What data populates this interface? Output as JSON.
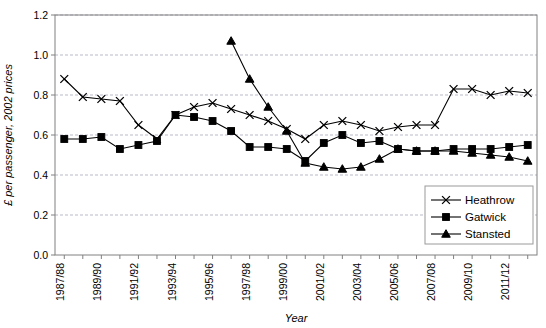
{
  "chart_data": {
    "type": "line",
    "title": "",
    "xlabel": "Year",
    "ylabel": "£ per passenger, 2002 prices",
    "ylim": [
      0.0,
      1.2
    ],
    "ytick_labels": [
      "0.0",
      "0.2",
      "0.4",
      "0.6",
      "0.8",
      "1.0",
      "1.2"
    ],
    "ytick_values": [
      0.0,
      0.2,
      0.4,
      0.6,
      0.8,
      1.0,
      1.2
    ],
    "grid": true,
    "grid_axis": "y",
    "legend_position": "bottom-right",
    "x": [
      "1987/88",
      "1988/89",
      "1989/90",
      "1990/91",
      "1991/92",
      "1992/93",
      "1993/94",
      "1994/95",
      "1995/96",
      "1996/97",
      "1997/98",
      "1998/99",
      "1999/00",
      "2000/01",
      "2001/02",
      "2002/03",
      "2003/04",
      "2004/05",
      "2005/06",
      "2006/07",
      "2007/08",
      "2008/09",
      "2009/10",
      "2010/11",
      "2011/12",
      "2012/13"
    ],
    "xtick_labels": [
      "1987/88",
      "1989/90",
      "1991/92",
      "1993/94",
      "1995/96",
      "1997/98",
      "1999/00",
      "2001/02",
      "2003/04",
      "2005/06",
      "2007/08",
      "2009/10",
      "2011/12"
    ],
    "series": [
      {
        "name": "Heathrow",
        "marker": "x",
        "values": [
          0.88,
          0.79,
          0.78,
          0.77,
          0.65,
          0.58,
          0.7,
          0.74,
          0.76,
          0.73,
          0.7,
          0.67,
          0.63,
          0.58,
          0.65,
          0.67,
          0.65,
          0.62,
          0.64,
          0.65,
          0.65,
          0.83,
          0.83,
          0.8,
          0.82,
          0.81
        ]
      },
      {
        "name": "Gatwick",
        "marker": "square",
        "values": [
          0.58,
          0.58,
          0.59,
          0.53,
          0.55,
          0.57,
          0.7,
          0.69,
          0.67,
          0.62,
          0.54,
          0.54,
          0.53,
          0.47,
          0.56,
          0.6,
          0.56,
          0.57,
          0.53,
          0.52,
          0.52,
          0.53,
          0.53,
          0.53,
          0.54,
          0.55
        ]
      },
      {
        "name": "Stansted",
        "marker": "triangle",
        "values": [
          null,
          null,
          null,
          null,
          null,
          null,
          null,
          null,
          null,
          1.07,
          0.88,
          0.74,
          0.62,
          0.46,
          0.44,
          0.43,
          0.44,
          0.48,
          0.53,
          0.52,
          0.52,
          0.52,
          0.51,
          0.5,
          0.49,
          0.47
        ]
      }
    ]
  },
  "legend": {
    "entries": [
      {
        "label": "Heathrow"
      },
      {
        "label": "Gatwick"
      },
      {
        "label": "Stansted"
      }
    ]
  },
  "colors": {
    "series_stroke": "#000000",
    "grid": "#b9b9c9",
    "axis": "#808080",
    "background": "#ffffff"
  }
}
